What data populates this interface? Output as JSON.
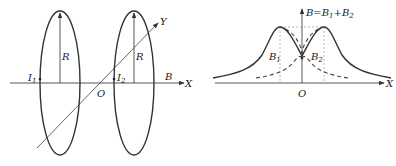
{
  "left_diagram": {
    "title": "Helmholtz coil pair",
    "labels": {
      "radius_left": "R",
      "radius_right": "R",
      "current_left": "I",
      "current_left_sub": "1",
      "current_right": "I",
      "current_right_sub": "2",
      "origin": "O",
      "field": "B",
      "x_axis": "X",
      "y_axis": "Y"
    }
  },
  "right_diagram": {
    "labels": {
      "total_field": "B=B",
      "total_field_sub1": "1",
      "total_plus": "+B",
      "total_field_sub2": "2",
      "b1": "B",
      "b1_sub": "1",
      "b2": "B",
      "b2_sub": "2",
      "origin": "O",
      "x_axis": "X"
    }
  },
  "colors": {
    "stroke": "#333333",
    "dashed": "#444444",
    "guide": "#888888"
  }
}
